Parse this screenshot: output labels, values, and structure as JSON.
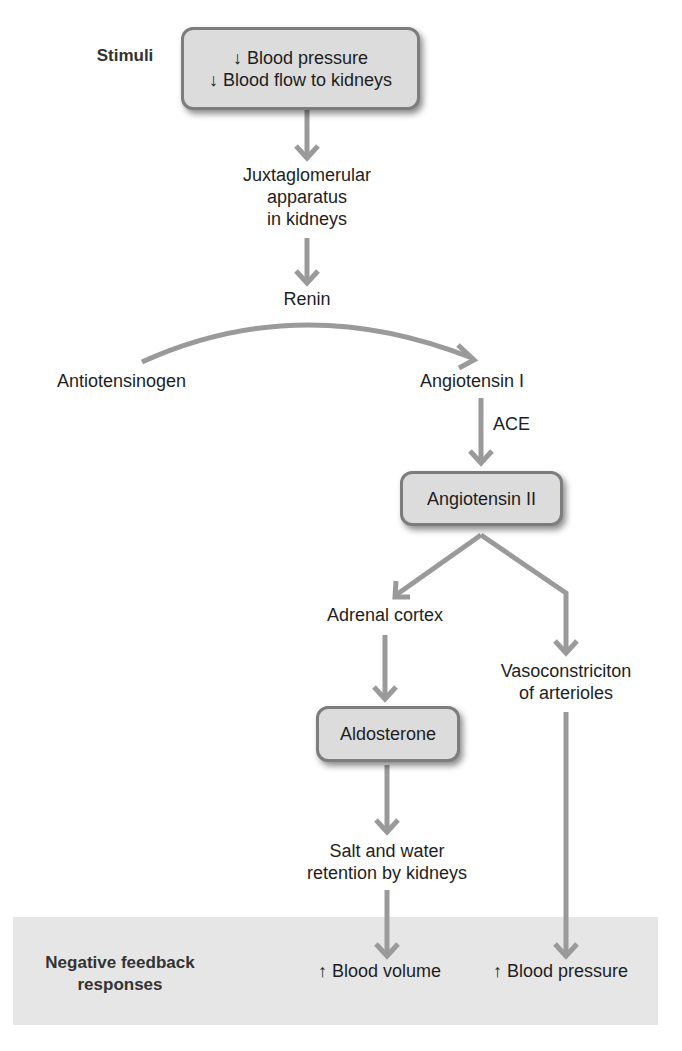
{
  "diagram": {
    "colors": {
      "arrow": "#9a9a9a",
      "box_fill": "#dcdcdc",
      "box_border": "#7d7d7d",
      "feedback_band": "#e6e6e6",
      "text": "#1e1e1e"
    },
    "row_labels": {
      "stimuli": "Stimuli",
      "feedback_line1": "Negative feedback",
      "feedback_line2": "responses"
    },
    "nodes": {
      "stimulus": {
        "line1": "↓ Blood pressure",
        "line2": "↓ Blood flow to kidneys"
      },
      "juxtaglomerular": {
        "line1": "Juxtaglomerular",
        "line2": "apparatus",
        "line3": "in kidneys"
      },
      "renin": "Renin",
      "angiotensinogen": "Antiotensinogen",
      "angiotensin_i": "Angiotensin I",
      "ace": "ACE",
      "angiotensin_ii": "Angiotensin II",
      "adrenal_cortex": "Adrenal cortex",
      "vasoconstriction": {
        "line1": "Vasoconstriciton",
        "line2": "of arterioles"
      },
      "aldosterone": "Aldosterone",
      "salt_water": {
        "line1": "Salt and water",
        "line2": "retention by kidneys"
      },
      "blood_volume": "↑ Blood volume",
      "blood_pressure_up": "↑ Blood pressure"
    },
    "edges": [
      {
        "from": "stimulus",
        "to": "juxtaglomerular"
      },
      {
        "from": "juxtaglomerular",
        "to": "renin"
      },
      {
        "from": "angiotensinogen",
        "to": "angiotensin_i",
        "via": "renin"
      },
      {
        "from": "angiotensin_i",
        "to": "angiotensin_ii",
        "label": "ACE"
      },
      {
        "from": "angiotensin_ii",
        "to": "adrenal_cortex"
      },
      {
        "from": "angiotensin_ii",
        "to": "vasoconstriction"
      },
      {
        "from": "adrenal_cortex",
        "to": "aldosterone"
      },
      {
        "from": "aldosterone",
        "to": "salt_water"
      },
      {
        "from": "salt_water",
        "to": "blood_volume"
      },
      {
        "from": "vasoconstriction",
        "to": "blood_pressure_up"
      }
    ]
  }
}
